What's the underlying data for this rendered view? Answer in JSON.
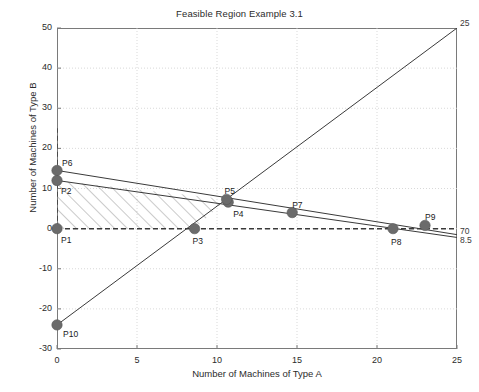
{
  "chart_data": {
    "type": "scatter",
    "title": "Feasible Region Example 3.1",
    "xlabel": "Number of Machines of Type A",
    "ylabel": "Number of Machines of Type B",
    "xlim": [
      0,
      25
    ],
    "ylim": [
      -30,
      50
    ],
    "xticks": [
      0,
      5,
      10,
      15,
      20,
      25
    ],
    "yticks": [
      -30,
      -20,
      -10,
      0,
      10,
      20,
      30,
      40,
      50
    ],
    "xtick_labels": [
      "0",
      "5",
      "10",
      "15",
      "20",
      "25"
    ],
    "ytick_labels": [
      "-30",
      "-20",
      "-10",
      "0",
      "10",
      "20",
      "30",
      "40",
      "50"
    ],
    "grid": true,
    "grid_style": "dotted",
    "legend": "none",
    "points": [
      {
        "name": "P1",
        "x": 0.0,
        "y": 0.0,
        "label_dx": 4,
        "label_dy": 12
      },
      {
        "name": "P2",
        "x": 0.0,
        "y": 12.0,
        "label_dx": 4,
        "label_dy": 12
      },
      {
        "name": "P3",
        "x": 8.6,
        "y": 0.0,
        "label_dx": -2,
        "label_dy": 13
      },
      {
        "name": "P4",
        "x": 10.7,
        "y": 6.6,
        "label_dx": 5,
        "label_dy": 13
      },
      {
        "name": "P5",
        "x": 10.6,
        "y": 7.3,
        "label_dx": -2,
        "label_dy": -7
      },
      {
        "name": "P6",
        "x": 0.0,
        "y": 14.5,
        "label_dx": 5,
        "label_dy": -6
      },
      {
        "name": "P7",
        "x": 14.7,
        "y": 4.0,
        "label_dx": 0,
        "label_dy": -7
      },
      {
        "name": "P8",
        "x": 21.0,
        "y": 0.0,
        "label_dx": -2,
        "label_dy": 14
      },
      {
        "name": "P9",
        "x": 23.0,
        "y": 0.8,
        "label_dx": 0,
        "label_dy": -7
      },
      {
        "name": "P10",
        "x": 0.0,
        "y": -24.0,
        "label_dx": 6,
        "label_dy": 10
      }
    ],
    "lines": [
      {
        "name": "constraint-steep-rising",
        "style": "solid",
        "x1": 0.0,
        "y1": -24.0,
        "x2": 25.0,
        "y2": 50.0
      },
      {
        "name": "constraint-upper",
        "style": "solid",
        "x1": 0.0,
        "y1": 14.5,
        "x2": 25.0,
        "y2": -1.5
      },
      {
        "name": "constraint-lower",
        "style": "solid",
        "x1": 0.0,
        "y1": 12.0,
        "x2": 25.0,
        "y2": -2.2
      },
      {
        "name": "axis-y-equals-zero",
        "style": "dashed",
        "x1": 0.0,
        "y1": 0.0,
        "x2": 25.0,
        "y2": 0.0
      },
      {
        "name": "axis-x-equals-zero",
        "style": "dashed",
        "x1": 0.0,
        "y1": 0.0,
        "x2": 0.0,
        "y2": 25.0
      }
    ],
    "end_labels": [
      {
        "name": "label-25",
        "text": "25",
        "x": 25.0,
        "y": 50.0,
        "dx": 3,
        "dy": -4
      },
      {
        "name": "label-70",
        "text": "70",
        "x": 25.0,
        "y": -1.5,
        "dx": 3,
        "dy": -3
      },
      {
        "name": "label-8-5",
        "text": "8.5",
        "x": 25.0,
        "y": -2.2,
        "dx": 3,
        "dy": 4
      }
    ],
    "feasible_region": {
      "name": "feasible-region-hatched",
      "hatch": "diagonal-forward",
      "vertices": [
        {
          "x": 0.0,
          "y": 0.0
        },
        {
          "x": 0.0,
          "y": 12.0
        },
        {
          "x": 10.6,
          "y": 7.3
        },
        {
          "x": 8.6,
          "y": 0.0
        }
      ]
    },
    "colors": {
      "marker": "#6b6b6b",
      "line": "#3a3a3a",
      "hatch": "#8a8a8a",
      "grid": "#cfcfcf",
      "axis": "#7a7a7a",
      "text": "#2b2b2b"
    }
  }
}
